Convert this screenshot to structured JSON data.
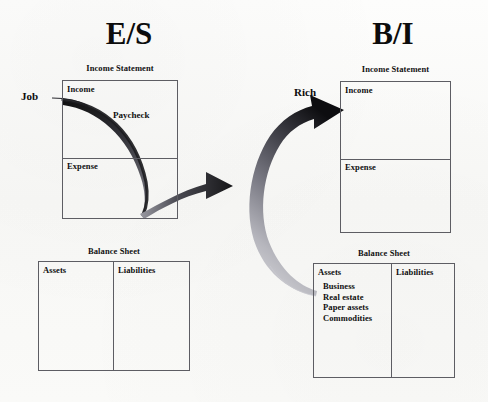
{
  "diagram": {
    "title_left": "E/S",
    "title_right": "B/I",
    "background_color": "#fbfbfa",
    "line_color": "#5d5d63",
    "ink_color": "#111111"
  },
  "left_panel": {
    "heading": "E/S",
    "income_statement": {
      "caption": "Income Statement",
      "income_label": "Income",
      "expense_label": "Expense",
      "flow_label": "Paycheck"
    },
    "balance_sheet": {
      "caption": "Balance Sheet",
      "assets_label": "Assets",
      "liabilities_label": "Liabilities",
      "assets_items": [],
      "liabilities_items": []
    },
    "source_label": "Job"
  },
  "right_panel": {
    "heading": "B/I",
    "income_statement": {
      "caption": "Income Statement",
      "income_label": "Income",
      "expense_label": "Expense"
    },
    "balance_sheet": {
      "caption": "Balance Sheet",
      "assets_label": "Assets",
      "liabilities_label": "Liabilities",
      "assets_items": [
        "Business",
        "Real estate",
        "Paper assets",
        "Commodities"
      ],
      "liabilities_items": []
    },
    "source_label": "Rich"
  },
  "arrows": {
    "transition_arrow_name": "right-arrow-es-to-bi",
    "asset_income_arrow_name": "curved-arrow-assets-to-income",
    "paycheck_curve_name": "paycheck-flow-curve",
    "job_line_name": "job-connector-line"
  }
}
